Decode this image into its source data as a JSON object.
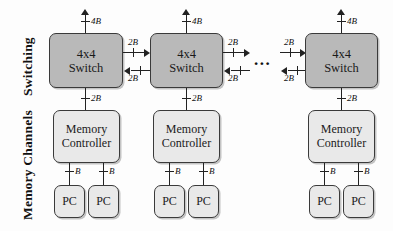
{
  "figure": {
    "side_labels": [
      {
        "text": "Switching",
        "id": "switching"
      },
      {
        "text": "Memory Channels",
        "id": "memory-channels"
      }
    ],
    "ellipsis": "...",
    "columns": [
      {
        "id": "column-1",
        "switch": {
          "line1": "4x4",
          "line2": "Switch"
        },
        "uplink_label": "4B",
        "downlink_label": "2B",
        "memory_controller": {
          "line1": "Memory",
          "line2": "Controller"
        },
        "pcs": [
          {
            "label": "PC",
            "link_label": "B"
          },
          {
            "label": "PC",
            "link_label": "B"
          }
        ],
        "right_links": [
          {
            "direction": "right",
            "label": "2B"
          },
          {
            "direction": "left",
            "label": "2B"
          }
        ]
      },
      {
        "id": "column-2",
        "switch": {
          "line1": "4x4",
          "line2": "Switch"
        },
        "uplink_label": "4B",
        "downlink_label": "2B",
        "memory_controller": {
          "line1": "Memory",
          "line2": "Controller"
        },
        "pcs": [
          {
            "label": "PC",
            "link_label": "B"
          },
          {
            "label": "PC",
            "link_label": "B"
          }
        ],
        "right_links": [
          {
            "direction": "right",
            "label": "2B"
          },
          {
            "direction": "left",
            "label": "2B"
          }
        ]
      },
      {
        "id": "column-3",
        "switch": {
          "line1": "4x4",
          "line2": "Switch"
        },
        "uplink_label": "4B",
        "downlink_label": "2B",
        "memory_controller": {
          "line1": "Memory",
          "line2": "Controller"
        },
        "pcs": [
          {
            "label": "PC",
            "link_label": "B"
          },
          {
            "label": "PC",
            "link_label": "B"
          }
        ],
        "left_links": [
          {
            "direction": "right",
            "label": "2B"
          },
          {
            "direction": "left",
            "label": "2B"
          }
        ]
      }
    ],
    "colors": {
      "switch_fill": "#b9b9b9",
      "node_fill": "#e9e9e9",
      "stroke": "#3a3a3a",
      "wire": "#222222",
      "background": "#fdfdfd"
    }
  }
}
